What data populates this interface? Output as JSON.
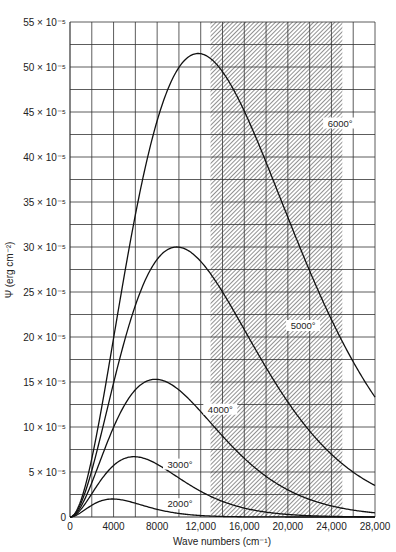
{
  "chart_data": {
    "type": "line",
    "title": "",
    "xlabel": "Wave numbers (cm⁻¹)",
    "ylabel": "Ψ (erg cm⁻²)",
    "xlim": [
      0,
      28000
    ],
    "ylim": [
      0,
      0.00055
    ],
    "grid": true,
    "x_ticks": [
      0,
      4000,
      8000,
      12000,
      16000,
      20000,
      24000,
      28000
    ],
    "x_tick_labels": [
      "0",
      "4000",
      "8000",
      "12,000",
      "16,000",
      "20,000",
      "24,000",
      "28,000"
    ],
    "y_ticks": [
      0,
      5e-05,
      0.0001,
      0.00015,
      0.0002,
      0.00025,
      0.0003,
      0.00035,
      0.0004,
      0.00045,
      0.0005,
      0.00055
    ],
    "y_tick_labels": [
      "0",
      "5 × 10⁻⁵",
      "10 × 10⁻⁵",
      "15 × 10⁻⁵",
      "20 × 10⁻⁵",
      "25 × 10⁻⁵",
      "30 × 10⁻⁵",
      "35 × 10⁻⁵",
      "40 × 10⁻⁵",
      "45 × 10⁻⁵",
      "50 × 10⁻⁵",
      "55 × 10⁻⁵"
    ],
    "x_grid_step": 2000,
    "y_grid_step": 2.5e-05,
    "shaded_region": {
      "x_start": 12900,
      "x_end": 25000,
      "pattern": "diagonal-hatch",
      "label": "visible band"
    },
    "series": [
      {
        "name": "6000°",
        "temperature_K": 6000,
        "peak_x": 11800,
        "peak_y": 0.000515,
        "label_pos": [
          24800,
          0.000435
        ]
      },
      {
        "name": "5000°",
        "temperature_K": 5000,
        "peak_x": 9800,
        "peak_y": 0.0003,
        "label_pos": [
          21400,
          0.00021
        ]
      },
      {
        "name": "4000°",
        "temperature_K": 4000,
        "peak_x": 7900,
        "peak_y": 0.000153,
        "label_pos": [
          13800,
          0.000117
        ]
      },
      {
        "name": "3000°",
        "temperature_K": 3000,
        "peak_x": 5900,
        "peak_y": 6.7e-05,
        "label_pos": [
          10100,
          5.6e-05
        ]
      },
      {
        "name": "2000°",
        "temperature_K": 2000,
        "peak_x": 3900,
        "peak_y": 2e-05,
        "label_pos": [
          10100,
          1.2e-05
        ]
      }
    ]
  }
}
